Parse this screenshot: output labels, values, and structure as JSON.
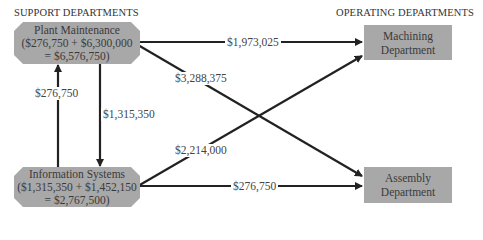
{
  "headers": {
    "support": "SUPPORT DEPARTMENTS",
    "operating": "OPERATING DEPARTMENTS"
  },
  "support_departments": [
    {
      "name": "Plant Maintenance",
      "line2": "($276,750 + $6,300,000",
      "line3": "= $6,576,750)"
    },
    {
      "name": "Information Systems",
      "line2": "($1,315,350 + $1,452,150",
      "line3": "= $2,767,500)"
    }
  ],
  "operating_departments": [
    {
      "line1": "Machining",
      "line2": "Department"
    },
    {
      "line1": "Assembly",
      "line2": "Department"
    }
  ],
  "flows": [
    {
      "from": "Plant Maintenance",
      "to": "Machining Department",
      "amount": "$1,973,025"
    },
    {
      "from": "Plant Maintenance",
      "to": "Assembly Department",
      "amount": "$3,288,375"
    },
    {
      "from": "Plant Maintenance",
      "to": "Information Systems",
      "amount": "$1,315,350"
    },
    {
      "from": "Information Systems",
      "to": "Plant Maintenance",
      "amount": "$276,750"
    },
    {
      "from": "Information Systems",
      "to": "Machining Department",
      "amount": "$2,214,000"
    },
    {
      "from": "Information Systems",
      "to": "Assembly Department",
      "amount": "$276,750"
    }
  ],
  "colors": {
    "box_fill": "#a8a8a8",
    "arrow": "#222222"
  }
}
